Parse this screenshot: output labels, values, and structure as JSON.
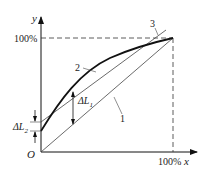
{
  "figure": {
    "axes": {
      "x_label": "x",
      "y_label": "y",
      "origin_label": "O",
      "x_max_label": "100%",
      "y_max_label": "100%"
    },
    "curves": [
      {
        "id": "1",
        "label": "1",
        "description": "ideal straight line from origin to (100%,100%)"
      },
      {
        "id": "2",
        "label": "2",
        "description": "actual characteristic curve (bold)"
      },
      {
        "id": "3",
        "label": "3",
        "description": "fitted reference straight line"
      }
    ],
    "annotations": {
      "delta_l1_main": "ΔL",
      "delta_l1_sub": "1",
      "delta_l2_main": "ΔL",
      "delta_l2_sub": "2"
    }
  }
}
